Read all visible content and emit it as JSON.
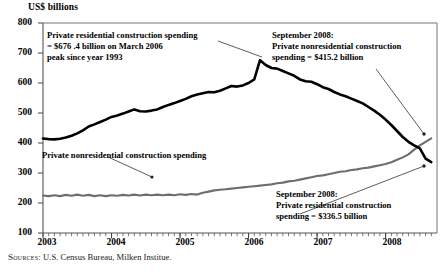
{
  "chart_data": {
    "type": "line",
    "title": "",
    "ylabel": "US$ billions",
    "xlabel": "",
    "ylim": [
      100,
      800
    ],
    "yticks": [
      100,
      200,
      300,
      400,
      500,
      600,
      700,
      800
    ],
    "xlim": [
      "2003-01",
      "2008-09"
    ],
    "xticks": [
      "2003",
      "2004",
      "2005",
      "2006",
      "2007",
      "2008"
    ],
    "grid": false,
    "legend": "inline-annotations",
    "x": [
      "2003-01",
      "2003-02",
      "2003-03",
      "2003-04",
      "2003-05",
      "2003-06",
      "2003-07",
      "2003-08",
      "2003-09",
      "2003-10",
      "2003-11",
      "2003-12",
      "2004-01",
      "2004-02",
      "2004-03",
      "2004-04",
      "2004-05",
      "2004-06",
      "2004-07",
      "2004-08",
      "2004-09",
      "2004-10",
      "2004-11",
      "2004-12",
      "2005-01",
      "2005-02",
      "2005-03",
      "2005-04",
      "2005-05",
      "2005-06",
      "2005-07",
      "2005-08",
      "2005-09",
      "2005-10",
      "2005-11",
      "2005-12",
      "2006-01",
      "2006-02",
      "2006-03",
      "2006-04",
      "2006-05",
      "2006-06",
      "2006-07",
      "2006-08",
      "2006-09",
      "2006-10",
      "2006-11",
      "2006-12",
      "2007-01",
      "2007-02",
      "2007-03",
      "2007-04",
      "2007-05",
      "2007-06",
      "2007-07",
      "2007-08",
      "2007-09",
      "2007-10",
      "2007-11",
      "2007-12",
      "2008-01",
      "2008-02",
      "2008-03",
      "2008-04",
      "2008-05",
      "2008-06",
      "2008-07",
      "2008-08",
      "2008-09"
    ],
    "series": [
      {
        "name": "Private residential construction spending",
        "color": "#000000",
        "values": [
          415,
          413,
          412,
          414,
          418,
          424,
          432,
          442,
          455,
          462,
          470,
          478,
          487,
          492,
          498,
          505,
          512,
          506,
          505,
          508,
          512,
          520,
          527,
          533,
          540,
          547,
          556,
          562,
          566,
          570,
          569,
          574,
          582,
          590,
          588,
          592,
          600,
          612,
          676,
          660,
          650,
          648,
          640,
          632,
          624,
          612,
          606,
          604,
          596,
          586,
          580,
          570,
          562,
          556,
          548,
          540,
          532,
          520,
          508,
          494,
          478,
          460,
          440,
          420,
          404,
          392,
          382,
          348,
          336.5
        ]
      },
      {
        "name": "Private nonresidential construction spending",
        "color": "#6e6e6e",
        "values": [
          225,
          223,
          226,
          223,
          227,
          224,
          228,
          224,
          227,
          223,
          226,
          223,
          226,
          224,
          227,
          225,
          228,
          225,
          228,
          226,
          228,
          226,
          228,
          226,
          229,
          227,
          230,
          228,
          234,
          238,
          242,
          244,
          246,
          248,
          250,
          252,
          254,
          256,
          258,
          260,
          262,
          266,
          268,
          272,
          274,
          278,
          282,
          286,
          290,
          292,
          296,
          300,
          304,
          306,
          310,
          312,
          316,
          318,
          322,
          326,
          330,
          336,
          344,
          352,
          362,
          378,
          392,
          404,
          415.2
        ]
      }
    ],
    "annotations": [
      {
        "name": "residential-peak-annotation",
        "lines": [
          "Private residential construction spending",
          "= $676 .4 billion on March 2006",
          "peak since year 1993"
        ]
      },
      {
        "name": "nonresidential-sept2008-annotation",
        "lines": [
          "September 2008:",
          "Private nonresidential construction",
          "spending = $415.2 billion"
        ]
      },
      {
        "name": "residential-sept2008-annotation",
        "lines": [
          "September 2008:",
          "Private residential construction",
          "spending = $336.5 billion"
        ]
      },
      {
        "name": "nonresidential-series-label",
        "lines": [
          "Private nonresidential construction spending"
        ]
      }
    ]
  },
  "axis": {
    "y_title": "US$ billions",
    "y_ticks": [
      "800",
      "700",
      "600",
      "500",
      "400",
      "300",
      "200",
      "100"
    ],
    "x_ticks": [
      "2003",
      "2004",
      "2005",
      "2006",
      "2007",
      "2008"
    ]
  },
  "annotations": {
    "residential_peak": {
      "line1": "Private residential construction spending",
      "line2": "= $676 .4 billion on March 2006",
      "line3": "peak since year 1993"
    },
    "nonres_sept": {
      "line1": "September 2008:",
      "line2": "Private nonresidential construction",
      "line3": "spending = $415.2 billion"
    },
    "res_sept": {
      "line1": "September 2008:",
      "line2": "Private residential construction",
      "line3": "spending = $336.5 billion"
    },
    "nonres_label": "Private nonresidential construction spending"
  },
  "source": {
    "label": "Sources:",
    "text": " U.S. Census Bureau, Milken Institue."
  },
  "colors": {
    "residential_line": "#000000",
    "nonresidential_line": "#6e6e6e",
    "axis": "#4a4a4a",
    "text": "#000000"
  }
}
